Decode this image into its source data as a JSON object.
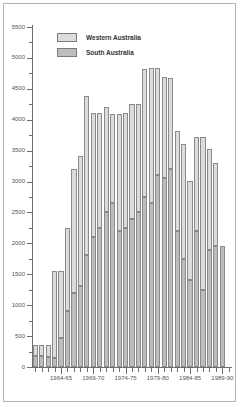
{
  "chart_data": {
    "type": "bar",
    "subtype": "stacked-column",
    "title": "",
    "xlabel": "",
    "ylabel": "",
    "ylim": [
      0,
      5500
    ],
    "ytick_step": 500,
    "ytick_labels": [
      "0",
      "500",
      "1000",
      "1500",
      "2000",
      "2500",
      "3000",
      "3500",
      "4000",
      "4500",
      "5000",
      "5500"
    ],
    "ytick_values": [
      0,
      500,
      1000,
      1500,
      2000,
      2500,
      3000,
      3500,
      4000,
      4500,
      5000,
      5500
    ],
    "grid": false,
    "legend_position": "top-left",
    "legend": [
      "Western Australia",
      "South Australia"
    ],
    "categories": [
      "1960-61",
      "1961-62",
      "1962-63",
      "1963-64",
      "1964-65",
      "1965-66",
      "1966-67",
      "1967-68",
      "1968-69",
      "1969-70",
      "1970-71",
      "1971-72",
      "1972-73",
      "1973-74",
      "1974-75",
      "1975-76",
      "1976-77",
      "1977-78",
      "1978-79",
      "1979-80",
      "1980-81",
      "1981-82",
      "1982-83",
      "1983-84",
      "1984-85",
      "1985-86",
      "1986-87",
      "1987-88",
      "1988-89",
      "1989-90",
      "1990-91"
    ],
    "xtick_labels": [
      "1964-65",
      "1969-70",
      "1974-75",
      "1979-80",
      "1984-85",
      "1989-90"
    ],
    "xtick_category_index": [
      4,
      9,
      14,
      19,
      24,
      29
    ],
    "series": [
      {
        "name": "South Australia",
        "color": "#bdbdbd",
        "values": [
          180,
          180,
          170,
          150,
          470,
          900,
          1200,
          1310,
          1820,
          2100,
          2250,
          2500,
          2650,
          2200,
          2250,
          2400,
          2500,
          2750,
          2650,
          3100,
          3050,
          3200,
          2200,
          1750,
          1400,
          2200,
          1250,
          1900,
          1950,
          1950,
          0
        ]
      },
      {
        "name": "Western Australia",
        "color": "#dcdcdc",
        "values": [
          170,
          180,
          180,
          1400,
          1080,
          1350,
          2000,
          2100,
          2570,
          2010,
          1860,
          1700,
          1440,
          1900,
          1860,
          1860,
          1760,
          2070,
          2190,
          1730,
          1640,
          1480,
          1620,
          1860,
          1610,
          1520,
          2470,
          1620,
          1350,
          0,
          0
        ]
      }
    ],
    "totals": [
      350,
      360,
      350,
      1550,
      1550,
      2250,
      3200,
      3410,
      4390,
      4110,
      4110,
      4200,
      4090,
      4100,
      4110,
      4260,
      4260,
      4820,
      4840,
      4830,
      4690,
      4680,
      3820,
      3610,
      3010,
      3720,
      3720,
      3520,
      3300,
      1950,
      0
    ]
  }
}
